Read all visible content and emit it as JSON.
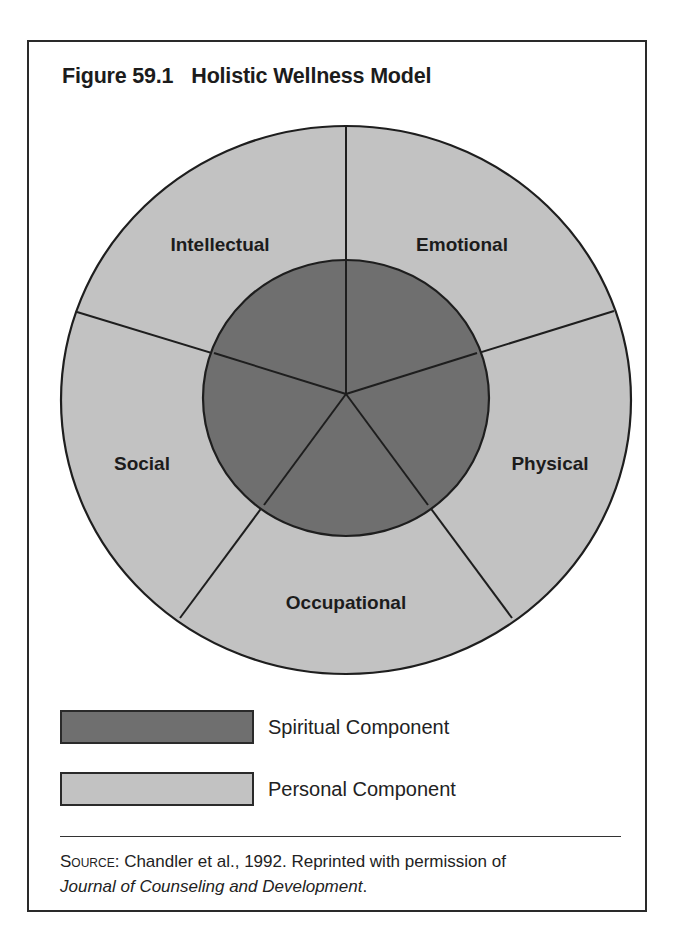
{
  "figure": {
    "number": "Figure 59.1",
    "title": "Holistic Wellness Model"
  },
  "diagram": {
    "center_label": "Spiritual",
    "segments": [
      {
        "label": "Emotional"
      },
      {
        "label": "Physical"
      },
      {
        "label": "Occupational"
      },
      {
        "label": "Social"
      },
      {
        "label": "Intellectual"
      }
    ]
  },
  "legend": [
    {
      "label": "Spiritual Component",
      "color": "#6f6f6f"
    },
    {
      "label": "Personal Component",
      "color": "#c2c2c2"
    }
  ],
  "source": {
    "prefix": "Source",
    "text": ": Chandler et al., 1992. Reprinted with permission of",
    "journal": "Journal of Counseling and Development",
    "suffix": "."
  },
  "colors": {
    "outer_ring": "#c2c2c2",
    "inner_circle": "#6f6f6f",
    "stroke": "#1e1e1e"
  }
}
